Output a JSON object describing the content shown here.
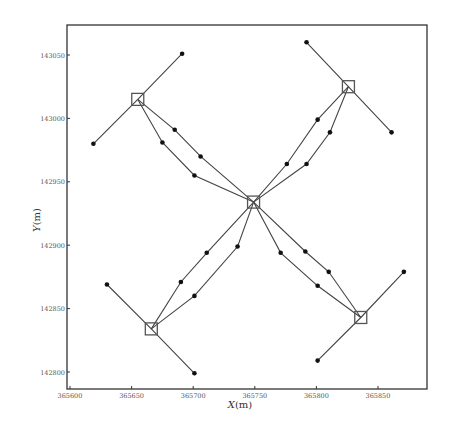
{
  "chart_data": {
    "type": "line",
    "title": "",
    "xlabel": "X(m)",
    "ylabel": "Y(m)",
    "xlim": [
      365590,
      365885
    ],
    "ylim": [
      142787,
      143074
    ],
    "grid": false,
    "legend": null,
    "x_ticks": [
      365600,
      365650,
      365700,
      365750,
      365800,
      365850
    ],
    "y_ticks": [
      142800,
      142850,
      142900,
      142950,
      143000,
      143050
    ],
    "x_tick_labels": [
      "365600",
      "365650",
      "365700",
      "365750",
      "365800",
      "365850"
    ],
    "y_tick_labels": [
      "142800",
      "142850",
      "142900",
      "142950",
      "143000",
      "143050"
    ],
    "square_markers": [
      {
        "name": "center",
        "x": 365749,
        "y": 142934
      },
      {
        "name": "top-left",
        "x": 365655,
        "y": 143015
      },
      {
        "name": "top-right",
        "x": 365826,
        "y": 143025
      },
      {
        "name": "bottom-right",
        "x": 365836,
        "y": 142843
      },
      {
        "name": "bottom-left",
        "x": 365666,
        "y": 142834
      }
    ],
    "series": [
      {
        "name": "tl-arm",
        "x": [
          365691,
          365655,
          365619
        ],
        "y": [
          143051,
          143015,
          142980
        ]
      },
      {
        "name": "tr-arm",
        "x": [
          365792,
          365826,
          365861
        ],
        "y": [
          143060,
          143025,
          142989
        ]
      },
      {
        "name": "br-arm",
        "x": [
          365871,
          365836,
          365801
        ],
        "y": [
          142879,
          142843,
          142809
        ]
      },
      {
        "name": "bl-arm",
        "x": [
          365630,
          365666,
          365701
        ],
        "y": [
          142869,
          142834,
          142799
        ]
      },
      {
        "name": "tl-path-a",
        "x": [
          365655,
          365685,
          365706,
          365749
        ],
        "y": [
          143015,
          142991,
          142970,
          142934
        ]
      },
      {
        "name": "tl-path-b",
        "x": [
          365655,
          365675,
          365701,
          365749
        ],
        "y": [
          143015,
          142981,
          142955,
          142934
        ]
      },
      {
        "name": "tr-path-a",
        "x": [
          365826,
          365801,
          365776,
          365749
        ],
        "y": [
          143025,
          142999,
          142964,
          142934
        ]
      },
      {
        "name": "tr-path-b",
        "x": [
          365826,
          365811,
          365792,
          365749
        ],
        "y": [
          143025,
          142989,
          142964,
          142934
        ]
      },
      {
        "name": "br-path-a",
        "x": [
          365836,
          365801,
          365771,
          365749
        ],
        "y": [
          142843,
          142868,
          142894,
          142934
        ]
      },
      {
        "name": "br-path-b",
        "x": [
          365836,
          365810,
          365791,
          365749
        ],
        "y": [
          142843,
          142879,
          142895,
          142934
        ]
      },
      {
        "name": "bl-path-a",
        "x": [
          365666,
          365690,
          365711,
          365749
        ],
        "y": [
          142834,
          142871,
          142894,
          142934
        ]
      },
      {
        "name": "bl-path-b",
        "x": [
          365666,
          365701,
          365736,
          365749
        ],
        "y": [
          142834,
          142860,
          142899,
          142934
        ]
      }
    ],
    "dot_points": [
      {
        "x": 365691,
        "y": 143051
      },
      {
        "x": 365619,
        "y": 142980
      },
      {
        "x": 365792,
        "y": 143060
      },
      {
        "x": 365861,
        "y": 142989
      },
      {
        "x": 365871,
        "y": 142879
      },
      {
        "x": 365801,
        "y": 142809
      },
      {
        "x": 365630,
        "y": 142869
      },
      {
        "x": 365701,
        "y": 142799
      },
      {
        "x": 365685,
        "y": 142991
      },
      {
        "x": 365706,
        "y": 142970
      },
      {
        "x": 365675,
        "y": 142981
      },
      {
        "x": 365701,
        "y": 142955
      },
      {
        "x": 365801,
        "y": 142999
      },
      {
        "x": 365776,
        "y": 142964
      },
      {
        "x": 365811,
        "y": 142989
      },
      {
        "x": 365792,
        "y": 142964
      },
      {
        "x": 365771,
        "y": 142894
      },
      {
        "x": 365801,
        "y": 142868
      },
      {
        "x": 365791,
        "y": 142895
      },
      {
        "x": 365810,
        "y": 142879
      },
      {
        "x": 365711,
        "y": 142894
      },
      {
        "x": 365690,
        "y": 142871
      },
      {
        "x": 365736,
        "y": 142899
      },
      {
        "x": 365701,
        "y": 142860
      }
    ]
  },
  "axes": {
    "xlabel_main": "X",
    "xlabel_unit": "(m)",
    "ylabel_main": "Y",
    "ylabel_unit": "(m)"
  }
}
